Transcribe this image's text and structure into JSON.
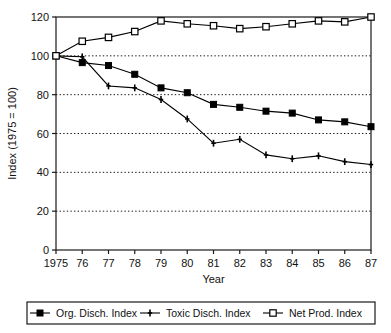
{
  "chart_data": {
    "type": "line",
    "title": "",
    "xlabel": "Year",
    "ylabel": "Index (1975 = 100)",
    "categories": [
      "1975",
      "76",
      "77",
      "78",
      "79",
      "80",
      "81",
      "82",
      "83",
      "84",
      "85",
      "86",
      "87"
    ],
    "x_tick_labels": [
      "1975",
      "76",
      "77",
      "78",
      "79",
      "80",
      "81",
      "82",
      "83",
      "84",
      "85",
      "86",
      "87"
    ],
    "y_tick_labels": [
      "0",
      "20",
      "40",
      "60",
      "80",
      "100",
      "120"
    ],
    "y_ticks": [
      0,
      20,
      40,
      60,
      80,
      100,
      120
    ],
    "ylim": [
      0,
      120
    ],
    "xlim": [
      1975,
      1987
    ],
    "grid": "horizontal-dotted",
    "legend_position": "below-plot-boxed",
    "series": [
      {
        "name": "Org. Disch. Index",
        "marker": "filled-square",
        "color": "#000000",
        "values": [
          100,
          96.5,
          95,
          90.5,
          83.5,
          81,
          75,
          73.5,
          71.5,
          70.5,
          67,
          66,
          63.5
        ]
      },
      {
        "name": "Toxic Disch. Index",
        "marker": "plus",
        "color": "#000000",
        "values": [
          100,
          99.5,
          84.5,
          83.5,
          77.5,
          67.5,
          55,
          57,
          49,
          47,
          48.5,
          45.5,
          44
        ]
      },
      {
        "name": "Net Prod. Index",
        "marker": "open-square",
        "color": "#000000",
        "values": [
          100,
          107.5,
          109.5,
          112.5,
          118,
          116.5,
          115.5,
          114,
          115,
          116.5,
          118,
          117.5,
          120
        ]
      }
    ]
  },
  "legend": {
    "items": [
      {
        "label": "Org. Disch. Index",
        "marker": "filled-square"
      },
      {
        "label": "Toxic Disch. Index",
        "marker": "plus"
      },
      {
        "label": "Net Prod. Index",
        "marker": "open-square"
      }
    ]
  },
  "axes": {
    "x_title": "Year",
    "y_title": "Index (1975 = 100)"
  }
}
